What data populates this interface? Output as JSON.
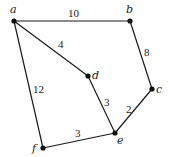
{
  "graph": {
    "nodes": [
      {
        "id": "a",
        "label": "a",
        "x": 14,
        "y": 21,
        "lx": 10,
        "ly": 13
      },
      {
        "id": "b",
        "label": "b",
        "x": 130,
        "y": 21,
        "lx": 126,
        "ly": 13
      },
      {
        "id": "c",
        "label": "c",
        "x": 152,
        "y": 89,
        "lx": 156,
        "ly": 93
      },
      {
        "id": "d",
        "label": "d",
        "x": 88,
        "y": 76,
        "lx": 92,
        "ly": 79
      },
      {
        "id": "e",
        "label": "e",
        "x": 115,
        "y": 133,
        "lx": 117,
        "ly": 144
      },
      {
        "id": "f",
        "label": "f",
        "x": 43,
        "y": 148,
        "lx": 32,
        "ly": 152
      }
    ],
    "edges": [
      {
        "from": "a",
        "to": "b",
        "weight": "10",
        "lx": 68,
        "ly": 17
      },
      {
        "from": "a",
        "to": "d",
        "weight": "4",
        "lx": 58,
        "ly": 48
      },
      {
        "from": "a",
        "to": "f",
        "weight": "12",
        "lx": 33,
        "ly": 93
      },
      {
        "from": "b",
        "to": "c",
        "weight": "8",
        "lx": 144,
        "ly": 56
      },
      {
        "from": "d",
        "to": "e",
        "weight": "3",
        "lx": 104,
        "ly": 106
      },
      {
        "from": "c",
        "to": "e",
        "weight": "2",
        "lx": 126,
        "ly": 113
      },
      {
        "from": "f",
        "to": "e",
        "weight": "3",
        "lx": 75,
        "ly": 137
      }
    ]
  }
}
